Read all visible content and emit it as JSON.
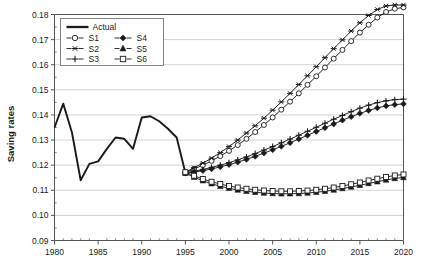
{
  "chart_data": {
    "type": "line",
    "title": "",
    "xlabel": "",
    "ylabel": "Saving rates",
    "xlim": [
      1980,
      2020
    ],
    "ylim": [
      0.09,
      0.18
    ],
    "xticks": [
      1980,
      1985,
      1990,
      1995,
      2000,
      2005,
      2010,
      2015,
      2020
    ],
    "xtick_labels": [
      "1980",
      "1985",
      "1990",
      "1995",
      "2000",
      "2005",
      "2010",
      "2015",
      "2020"
    ],
    "yticks": [
      0.09,
      0.1,
      0.11,
      0.12,
      0.13,
      0.14,
      0.15,
      0.16,
      0.17,
      0.18
    ],
    "ytick_labels": [
      "0.09",
      "0.10",
      "0.11",
      "0.12",
      "0.13",
      "0.14",
      "0.15",
      "0.16",
      "0.17",
      "0.18"
    ],
    "grid": "horizontal",
    "legend_position": "top-left-inside",
    "legend_entries": [
      {
        "name": "Actual",
        "marker": "none",
        "style": "thick-solid"
      },
      {
        "name": "S1",
        "marker": "open-circle",
        "style": "solid"
      },
      {
        "name": "S4",
        "marker": "filled-diamond",
        "style": "solid"
      },
      {
        "name": "S2",
        "marker": "asterisk",
        "style": "solid"
      },
      {
        "name": "S5",
        "marker": "filled-triangle",
        "style": "solid"
      },
      {
        "name": "S3",
        "marker": "plus",
        "style": "solid"
      },
      {
        "name": "S6",
        "marker": "open-square",
        "style": "solid"
      }
    ],
    "series": [
      {
        "name": "Actual",
        "marker": "none",
        "x": [
          1980,
          1981,
          1982,
          1983,
          1984,
          1985,
          1986,
          1987,
          1988,
          1989,
          1990,
          1991,
          1992,
          1993,
          1994,
          1995
        ],
        "values": [
          0.135,
          0.1445,
          0.133,
          0.114,
          0.1205,
          0.1215,
          0.1265,
          0.131,
          0.1305,
          0.1265,
          0.139,
          0.1395,
          0.1375,
          0.1345,
          0.131,
          0.117
        ]
      },
      {
        "name": "S1",
        "marker": "open-circle",
        "x": [
          1995,
          1996,
          1997,
          1998,
          1999,
          2000,
          2001,
          2002,
          2003,
          2004,
          2005,
          2006,
          2007,
          2008,
          2009,
          2010,
          2011,
          2012,
          2013,
          2014,
          2015,
          2016,
          2017,
          2018,
          2019,
          2020
        ],
        "values": [
          0.117,
          0.1185,
          0.12,
          0.1217,
          0.1236,
          0.1257,
          0.128,
          0.1305,
          0.1332,
          0.136,
          0.139,
          0.1421,
          0.1453,
          0.1486,
          0.152,
          0.1554,
          0.1589,
          0.1624,
          0.1659,
          0.1694,
          0.1728,
          0.1759,
          0.1788,
          0.181,
          0.1823,
          0.1828
        ]
      },
      {
        "name": "S2",
        "marker": "asterisk",
        "x": [
          1995,
          1996,
          1997,
          1998,
          1999,
          2000,
          2001,
          2002,
          2003,
          2004,
          2005,
          2006,
          2007,
          2008,
          2009,
          2010,
          2011,
          2012,
          2013,
          2014,
          2015,
          2016,
          2017,
          2018,
          2019,
          2020
        ],
        "values": [
          0.1172,
          0.119,
          0.1208,
          0.1228,
          0.125,
          0.1274,
          0.13,
          0.1328,
          0.1357,
          0.1387,
          0.1419,
          0.1452,
          0.1486,
          0.1521,
          0.1556,
          0.1592,
          0.1628,
          0.1664,
          0.1699,
          0.1734,
          0.1767,
          0.1796,
          0.182,
          0.1834,
          0.1838,
          0.1838
        ]
      },
      {
        "name": "S3",
        "marker": "plus",
        "x": [
          1995,
          1996,
          1997,
          1998,
          1999,
          2000,
          2001,
          2002,
          2003,
          2004,
          2005,
          2006,
          2007,
          2008,
          2009,
          2010,
          2011,
          2012,
          2013,
          2014,
          2015,
          2016,
          2017,
          2018,
          2019,
          2020
        ],
        "values": [
          0.117,
          0.1176,
          0.1183,
          0.1191,
          0.12,
          0.121,
          0.1221,
          0.1233,
          0.1246,
          0.126,
          0.1274,
          0.1289,
          0.1304,
          0.1319,
          0.1335,
          0.1351,
          0.1367,
          0.1383,
          0.1398,
          0.1413,
          0.1427,
          0.1439,
          0.1449,
          0.1456,
          0.1461,
          0.1463
        ]
      },
      {
        "name": "S4",
        "marker": "filled-diamond",
        "x": [
          1995,
          1996,
          1997,
          1998,
          1999,
          2000,
          2001,
          2002,
          2003,
          2004,
          2005,
          2006,
          2007,
          2008,
          2009,
          2010,
          2011,
          2012,
          2013,
          2014,
          2015,
          2016,
          2017,
          2018,
          2019,
          2020
        ],
        "values": [
          0.1168,
          0.1172,
          0.1178,
          0.1185,
          0.1193,
          0.1202,
          0.1212,
          0.1223,
          0.1235,
          0.1248,
          0.1261,
          0.1275,
          0.1289,
          0.1304,
          0.1319,
          0.1334,
          0.1349,
          0.1364,
          0.1379,
          0.1393,
          0.1406,
          0.1418,
          0.1428,
          0.1436,
          0.1441,
          0.1444
        ]
      },
      {
        "name": "S5",
        "marker": "filled-triangle",
        "x": [
          1995,
          1996,
          1997,
          1998,
          1999,
          2000,
          2001,
          2002,
          2003,
          2004,
          2005,
          2006,
          2007,
          2008,
          2009,
          2010,
          2011,
          2012,
          2013,
          2014,
          2015,
          2016,
          2017,
          2018,
          2019,
          2020
        ],
        "values": [
          0.1168,
          0.1152,
          0.1138,
          0.1126,
          0.1116,
          0.1108,
          0.1101,
          0.1096,
          0.1092,
          0.1089,
          0.1087,
          0.1086,
          0.1086,
          0.1087,
          0.1089,
          0.1092,
          0.1096,
          0.1101,
          0.1107,
          0.1113,
          0.112,
          0.1127,
          0.1134,
          0.1141,
          0.1147,
          0.1151
        ]
      },
      {
        "name": "S6",
        "marker": "open-square",
        "x": [
          1995,
          1996,
          1997,
          1998,
          1999,
          2000,
          2001,
          2002,
          2003,
          2004,
          2005,
          2006,
          2007,
          2008,
          2009,
          2010,
          2011,
          2012,
          2013,
          2014,
          2015,
          2016,
          2017,
          2018,
          2019,
          2020
        ],
        "values": [
          0.1172,
          0.1158,
          0.1145,
          0.1134,
          0.1125,
          0.1117,
          0.1111,
          0.1106,
          0.1102,
          0.1099,
          0.1097,
          0.1096,
          0.1096,
          0.1097,
          0.1099,
          0.1102,
          0.1106,
          0.1111,
          0.1117,
          0.1124,
          0.1131,
          0.1139,
          0.1146,
          0.1153,
          0.1159,
          0.1163
        ]
      }
    ],
    "colors": {
      "line": "#1a1a1a",
      "grid": "#c8c8c8",
      "axis": "#555555",
      "background": "#ffffff"
    }
  }
}
